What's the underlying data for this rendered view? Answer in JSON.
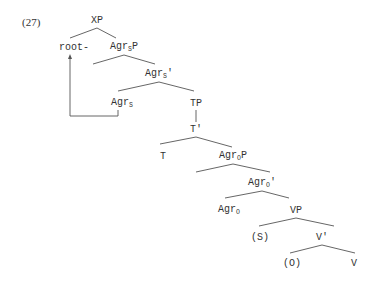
{
  "example_number": "(27)",
  "nodes": [
    {
      "id": "XP",
      "base": "XP",
      "sub": "",
      "suffix": "",
      "x": 97,
      "y": 21
    },
    {
      "id": "root",
      "base": "root-",
      "sub": "",
      "suffix": "",
      "x": 74,
      "y": 48
    },
    {
      "id": "AgrSP",
      "base": "Agr",
      "sub": "S",
      "suffix": "P",
      "x": 124,
      "y": 48
    },
    {
      "id": "AgrSbar",
      "base": "Agr",
      "sub": "S",
      "suffix": "'",
      "x": 159,
      "y": 75
    },
    {
      "id": "AgrS",
      "base": "Agr",
      "sub": "S",
      "suffix": "",
      "x": 122,
      "y": 104
    },
    {
      "id": "TP",
      "base": "TP",
      "sub": "",
      "suffix": "",
      "x": 196,
      "y": 104
    },
    {
      "id": "Tbar",
      "base": "T'",
      "sub": "",
      "suffix": "",
      "x": 196,
      "y": 130
    },
    {
      "id": "T",
      "base": "T",
      "sub": "",
      "suffix": "",
      "x": 163,
      "y": 157
    },
    {
      "id": "AgrOP",
      "base": "Agr",
      "sub": "O",
      "suffix": "P",
      "x": 233,
      "y": 157
    },
    {
      "id": "AgrObar",
      "base": "Agr",
      "sub": "O",
      "suffix": "'",
      "x": 262,
      "y": 184
    },
    {
      "id": "AgrO",
      "base": "Agr",
      "sub": "O",
      "suffix": "",
      "x": 229,
      "y": 211
    },
    {
      "id": "VP",
      "base": "VP",
      "sub": "",
      "suffix": "",
      "x": 296,
      "y": 211
    },
    {
      "id": "S",
      "base": "(S)",
      "sub": "",
      "suffix": "",
      "x": 260,
      "y": 238
    },
    {
      "id": "Vbar",
      "base": "V'",
      "sub": "",
      "suffix": "",
      "x": 322,
      "y": 238
    },
    {
      "id": "O",
      "base": "(O)",
      "sub": "",
      "suffix": "",
      "x": 292,
      "y": 264
    },
    {
      "id": "V",
      "base": "V",
      "sub": "",
      "suffix": "",
      "x": 354,
      "y": 264
    }
  ],
  "edges": [
    [
      70,
      38,
      97,
      28
    ],
    [
      97,
      28,
      116,
      38
    ],
    [
      93,
      64,
      124,
      55
    ],
    [
      124,
      55,
      155,
      64
    ],
    [
      118,
      91,
      159,
      82
    ],
    [
      159,
      82,
      194,
      91
    ],
    [
      196,
      110,
      196,
      122
    ],
    [
      160,
      144,
      196,
      137
    ],
    [
      196,
      137,
      232,
      147
    ],
    [
      196,
      172,
      233,
      164
    ],
    [
      233,
      164,
      270,
      172
    ],
    [
      225,
      198,
      262,
      191
    ],
    [
      262,
      191,
      289,
      198
    ],
    [
      259,
      226,
      296,
      218
    ],
    [
      296,
      218,
      334,
      226
    ],
    [
      290,
      253,
      322,
      245
    ],
    [
      322,
      245,
      355,
      253
    ]
  ],
  "movement_arrow": {
    "from": "AgrS",
    "to": "root",
    "points": [
      [
        118,
        110
      ],
      [
        118,
        116
      ],
      [
        70,
        116
      ],
      [
        70,
        57
      ]
    ]
  },
  "colors": {
    "line": "#555555",
    "text": "#333333"
  }
}
